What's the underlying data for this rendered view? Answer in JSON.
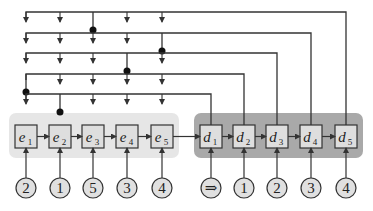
{
  "colors": {
    "line": "#333333",
    "encoder_panel": "#e6e6e6",
    "decoder_panel": "#a9a9a9",
    "box_fill": "#dedede",
    "circle_fill": "#e0e0e0"
  },
  "encoder": {
    "cells": [
      {
        "label": "e",
        "sub": "1",
        "input": "2"
      },
      {
        "label": "e",
        "sub": "2",
        "input": "1"
      },
      {
        "label": "e",
        "sub": "3",
        "input": "5"
      },
      {
        "label": "e",
        "sub": "4",
        "input": "3"
      },
      {
        "label": "e",
        "sub": "5",
        "input": "4"
      }
    ]
  },
  "decoder": {
    "cells": [
      {
        "label": "d",
        "sub": "1",
        "input": "⇒"
      },
      {
        "label": "d",
        "sub": "2",
        "input": "1"
      },
      {
        "label": "d",
        "sub": "3",
        "input": "2"
      },
      {
        "label": "d",
        "sub": "4",
        "input": "3"
      },
      {
        "label": "d",
        "sub": "5",
        "input": "4"
      }
    ]
  },
  "pointer_rows": [
    {
      "target_decoder": 5,
      "pointed_encoder": 3
    },
    {
      "target_decoder": 4,
      "pointed_encoder": 5
    },
    {
      "target_decoder": 3,
      "pointed_encoder": 4
    },
    {
      "target_decoder": 2,
      "pointed_encoder": 1
    },
    {
      "target_decoder": 1,
      "pointed_encoder": 2
    }
  ]
}
